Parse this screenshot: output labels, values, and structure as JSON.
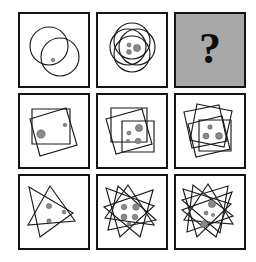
{
  "puzzle": {
    "title": "Visual analogy matrix",
    "rows": 3,
    "columns": 3,
    "unknown_marker": "?",
    "colors": {
      "background": "#ffffff",
      "cell_border": "#141414",
      "shape_stroke": "#1b1b1b",
      "dot_fill": "#8a8a8a",
      "dot_stroke": "#4f4f4f",
      "unknown_cell_fill": "#a8a8a8",
      "question_mark": "#0d0d0d"
    },
    "cells": [
      {
        "id": "cell-1",
        "position": "row1-col1",
        "shape_type": "circle",
        "shape_count": 2,
        "dot_count": 1,
        "is_unknown": false,
        "shapes": [
          {
            "cx": 29,
            "cy": 28,
            "r": 19
          },
          {
            "cx": 40,
            "cy": 39,
            "r": 19
          }
        ],
        "dots": [
          {
            "cx": 33,
            "cy": 42,
            "r": 1.7
          }
        ]
      },
      {
        "id": "cell-2",
        "position": "row1-col2",
        "shape_type": "circle",
        "shape_count": 4,
        "dot_count": 3,
        "is_unknown": false,
        "shapes": [
          {
            "cx": 30,
            "cy": 29,
            "r": 18
          },
          {
            "cx": 39,
            "cy": 29,
            "r": 18
          },
          {
            "cx": 34,
            "cy": 23,
            "r": 18
          },
          {
            "cx": 34,
            "cy": 36,
            "r": 18
          }
        ],
        "dots": [
          {
            "cx": 31,
            "cy": 27,
            "r": 2.1
          },
          {
            "cx": 31,
            "cy": 34,
            "r": 2.4
          },
          {
            "cx": 39,
            "cy": 30,
            "r": 3.6
          }
        ]
      },
      {
        "id": "cell-3",
        "position": "row1-col3",
        "shape_type": "unknown",
        "shape_count": 0,
        "dot_count": 0,
        "is_unknown": true,
        "shapes": [],
        "dots": []
      },
      {
        "id": "cell-4",
        "position": "row2-col1",
        "shape_type": "square",
        "shape_count": 2,
        "dot_count": 2,
        "is_unknown": false,
        "shapes": [
          {
            "points": "12,10 50,10 50,45 12,45"
          },
          {
            "points": "10,20 46,9 57,46 20,57"
          }
        ],
        "dots": [
          {
            "cx": 21,
            "cy": 35,
            "r": 4.2
          },
          {
            "cx": 45,
            "cy": 26,
            "r": 1.8
          }
        ]
      },
      {
        "id": "cell-5",
        "position": "row2-col2",
        "shape_type": "square",
        "shape_count": 3,
        "dot_count": 4,
        "is_unknown": false,
        "shapes": [
          {
            "points": "13,9 49,9 49,43 13,43"
          },
          {
            "points": "8,20 44,10 54,45 18,55"
          },
          {
            "points": "24,22 56,22 56,53 24,53"
          }
        ],
        "dots": [
          {
            "cx": 41,
            "cy": 29,
            "r": 3.6
          },
          {
            "cx": 31,
            "cy": 34,
            "r": 2.0
          },
          {
            "cx": 30,
            "cy": 42,
            "r": 1.7
          },
          {
            "cx": 40,
            "cy": 42,
            "r": 2.8
          }
        ]
      },
      {
        "id": "cell-6",
        "position": "row2-col3",
        "shape_type": "square",
        "shape_count": 4,
        "dot_count": 3,
        "is_unknown": false,
        "shapes": [
          {
            "points": "8,13 43,6 51,42 16,49"
          },
          {
            "points": "21,5 56,12 48,48 14,41"
          },
          {
            "points": "23,21 55,21 55,52 23,52"
          },
          {
            "points": "12,25 46,17 54,50 20,58"
          }
        ],
        "dots": [
          {
            "cx": 34,
            "cy": 28,
            "r": 2.2
          },
          {
            "cx": 30,
            "cy": 37,
            "r": 3.0
          },
          {
            "cx": 43,
            "cy": 37,
            "r": 3.4
          }
        ]
      },
      {
        "id": "cell-7",
        "position": "row3-col1",
        "shape_type": "triangle",
        "shape_count": 2,
        "dot_count": 3,
        "is_unknown": false,
        "shapes": [
          {
            "points": "9,7 53,33 20,57"
          },
          {
            "points": "30,6 55,41 8,45"
          }
        ],
        "dots": [
          {
            "cx": 29,
            "cy": 26,
            "r": 2.6
          },
          {
            "cx": 44,
            "cy": 32,
            "r": 1.9
          },
          {
            "cx": 29,
            "cy": 41,
            "r": 2.2
          }
        ]
      },
      {
        "id": "cell-8",
        "position": "row3-col2",
        "shape_type": "triangle",
        "shape_count": 4,
        "dot_count": 5,
        "is_unknown": false,
        "shapes": [
          {
            "points": "8,8 56,26 22,57"
          },
          {
            "points": "30,5 56,45 7,38"
          },
          {
            "points": "55,10 42,57 6,27"
          },
          {
            "points": "10,50 20,6 58,40"
          }
        ],
        "dots": [
          {
            "cx": 26,
            "cy": 27,
            "r": 2.7
          },
          {
            "cx": 38,
            "cy": 27,
            "r": 3.3
          },
          {
            "cx": 26,
            "cy": 37,
            "r": 3.0
          },
          {
            "cx": 37,
            "cy": 37,
            "r": 2.8
          },
          {
            "cx": 31,
            "cy": 44,
            "r": 1.9
          }
        ]
      },
      {
        "id": "cell-9",
        "position": "row3-col3",
        "shape_type": "triangle",
        "shape_count": 5,
        "dot_count": 4,
        "is_unknown": false,
        "shapes": [
          {
            "points": "7,9 55,24 21,57"
          },
          {
            "points": "32,4 57,44 8,40"
          },
          {
            "points": "56,12 40,57 6,30"
          },
          {
            "points": "11,52 17,5 57,36"
          },
          {
            "points": "6,20 52,6 44,53"
          }
        ],
        "dots": [
          {
            "cx": 36,
            "cy": 24,
            "r": 3.6
          },
          {
            "cx": 30,
            "cy": 33,
            "r": 2.0
          },
          {
            "cx": 37,
            "cy": 35,
            "r": 1.6
          },
          {
            "cx": 28,
            "cy": 44,
            "r": 3.4
          }
        ]
      }
    ]
  }
}
